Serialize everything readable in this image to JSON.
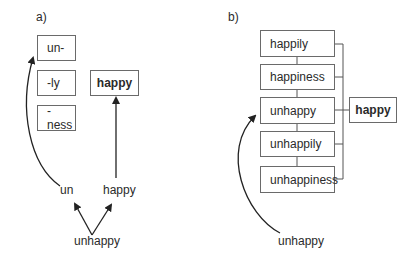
{
  "panel_a": {
    "label": "a)",
    "affix_boxes": [
      "un-",
      "-ly",
      "-ness"
    ],
    "root_box": "happy",
    "parts": {
      "left": "un",
      "right": "happy"
    },
    "input_word": "unhappy"
  },
  "panel_b": {
    "label": "b)",
    "word_boxes": [
      "happily",
      "happiness",
      "unhappy",
      "unhappily",
      "unhappiness"
    ],
    "root_box": "happy",
    "input_word": "unhappy"
  },
  "colors": {
    "line": "#222222",
    "box_border": "#6a6a6a",
    "text": "#2a2a2a"
  }
}
